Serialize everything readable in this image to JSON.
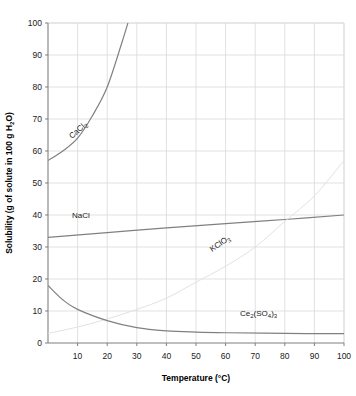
{
  "chart_data": {
    "type": "line",
    "title": "",
    "xlabel": "Temperature (°C)",
    "ylabel": "Solubility (g of solute in 100 g H₂O)",
    "xlim": [
      0,
      100
    ],
    "ylim": [
      0,
      100
    ],
    "xticks": [
      10,
      20,
      30,
      40,
      50,
      60,
      70,
      80,
      90,
      100
    ],
    "yticks": [
      0,
      10,
      20,
      30,
      40,
      50,
      60,
      70,
      80,
      90,
      100
    ],
    "grid": true,
    "legend": "inline-curve-labels",
    "series": [
      {
        "name": "CaCl₂",
        "label_main": "CaCl",
        "label_sub": "2",
        "color": "#808080",
        "x": [
          0,
          5,
          10,
          15,
          20,
          25,
          27
        ],
        "values": [
          57,
          60,
          64,
          71,
          80,
          94,
          100
        ]
      },
      {
        "name": "NaCl",
        "label_main": "NaCl",
        "label_sub": "",
        "color": "#808080",
        "x": [
          0,
          20,
          40,
          60,
          80,
          100
        ],
        "values": [
          33,
          34.5,
          36,
          37.3,
          38.6,
          40
        ]
      },
      {
        "name": "KClO₃",
        "label_main": "KClO",
        "label_sub": "3",
        "color": "#e2e2e2",
        "x": [
          0,
          10,
          20,
          30,
          40,
          50,
          60,
          70,
          80,
          90,
          100
        ],
        "values": [
          3,
          5,
          7.5,
          10.5,
          14,
          19,
          24,
          30,
          38,
          46,
          57
        ]
      },
      {
        "name": "Ce₂(SO₄)₃",
        "label_main_a": "Ce",
        "label_sub_a": "2",
        "label_main_b": "(SO",
        "label_sub_b": "4",
        "label_main_c": ")",
        "label_sub_c": "3",
        "color": "#808080",
        "x": [
          0,
          5,
          10,
          20,
          30,
          40,
          50,
          60,
          80,
          100
        ],
        "values": [
          18,
          13.5,
          10.5,
          7,
          4.8,
          3.8,
          3.4,
          3.2,
          3.0,
          2.9
        ]
      }
    ]
  },
  "axis": {
    "x_tick_labels": [
      "10",
      "20",
      "30",
      "40",
      "50",
      "60",
      "70",
      "80",
      "90",
      "100"
    ],
    "y_tick_labels": [
      "0",
      "10",
      "20",
      "30",
      "40",
      "50",
      "60",
      "70",
      "80",
      "90",
      "100"
    ],
    "x_title": "Temperature (°C)",
    "y_title_parts": {
      "pre": "Solubility (g of solute in 100 g H",
      "sub": "2",
      "post": "O)"
    }
  },
  "colors": {
    "curve": "#808080",
    "curve_faint": "#e2e2e2",
    "grid": "#d9d9d9",
    "axis": "#808080",
    "text": "#1a1a1a"
  }
}
